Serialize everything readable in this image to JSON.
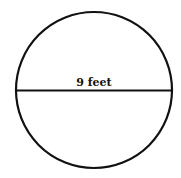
{
  "diagram": {
    "shape": "circle",
    "diameter_label": "9 feet",
    "stroke_color": "#111111",
    "background": "#ffffff"
  }
}
